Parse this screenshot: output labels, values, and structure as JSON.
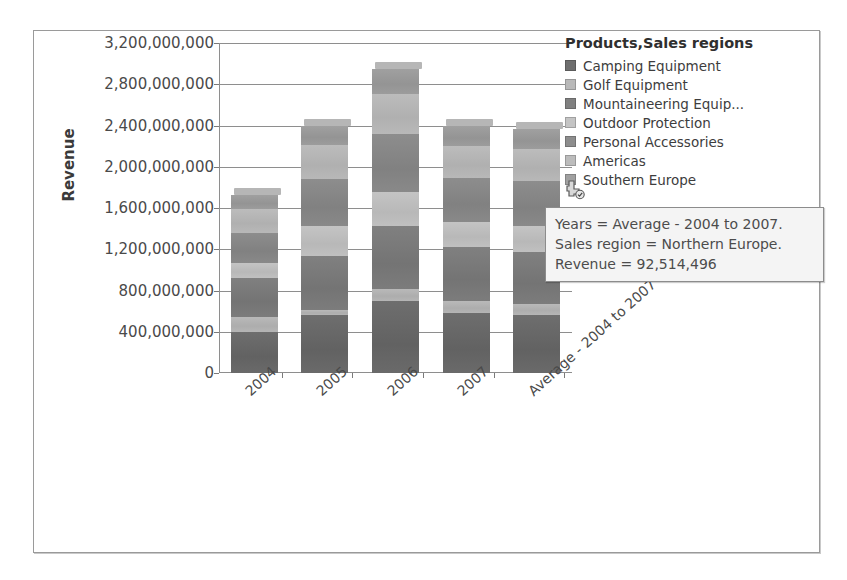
{
  "chart_data": {
    "type": "bar",
    "subtype": "stacked-column-3d",
    "title": "",
    "xlabel": "",
    "ylabel": "Revenue",
    "ylim": [
      0,
      3200000000
    ],
    "ytick_labels": [
      "3,200,000,000",
      "2,800,000,000",
      "2,400,000,000",
      "2,000,000,000",
      "1,600,000,000",
      "1,200,000,000",
      "800,000,000",
      "400,000,000",
      "0"
    ],
    "ytick_values": [
      3200000000,
      2800000000,
      2400000000,
      2000000000,
      1600000000,
      1200000000,
      800000000,
      400000000,
      0
    ],
    "grid": true,
    "legend_position": "right",
    "legend_title": "Products,Sales regions",
    "categories": [
      "2004",
      "2005",
      "2006",
      "2007",
      "Average - 2004 to 2007"
    ],
    "series": [
      {
        "name": "Camping Equipment",
        "color": "#6e6e6e",
        "values": [
          400000000,
          560000000,
          700000000,
          580000000,
          560000000
        ]
      },
      {
        "name": "Golf Equipment",
        "color": "#b9b9b9",
        "values": [
          140000000,
          50000000,
          110000000,
          120000000,
          105000000
        ]
      },
      {
        "name": "Mountaineering Equip...",
        "color": "#808080",
        "values": [
          380000000,
          520000000,
          620000000,
          520000000,
          510000000
        ]
      },
      {
        "name": "Outdoor Protection",
        "color": "#c4c4c4",
        "values": [
          150000000,
          300000000,
          330000000,
          240000000,
          255000000
        ]
      },
      {
        "name": "Personal Accessories",
        "color": "#8d8d8d",
        "values": [
          290000000,
          450000000,
          560000000,
          430000000,
          430000000
        ]
      },
      {
        "name": "Americas",
        "color": "#bcbcbc",
        "values": [
          230000000,
          330000000,
          390000000,
          310000000,
          315000000
        ]
      },
      {
        "name": "Southern Europe",
        "color": "#a0a0a0",
        "values": [
          140000000,
          190000000,
          240000000,
          200000000,
          195000000
        ]
      }
    ],
    "bar_totals": [
      1730000000,
      2400000000,
      2950000000,
      2400000000,
      2370000000
    ]
  },
  "legend": {
    "title": "Products,Sales regions",
    "items": [
      {
        "label": "Camping Equipment",
        "color": "#6e6e6e"
      },
      {
        "label": "Golf Equipment",
        "color": "#b9b9b9"
      },
      {
        "label": "Mountaineering Equip...",
        "color": "#808080"
      },
      {
        "label": "Outdoor Protection",
        "color": "#c4c4c4"
      },
      {
        "label": "Personal Accessories",
        "color": "#8d8d8d"
      },
      {
        "label": "Americas",
        "color": "#bcbcbc"
      },
      {
        "label": "Southern Europe",
        "color": "#a0a0a0"
      }
    ]
  },
  "tooltip": {
    "line1": "Years = Average - 2004 to 2007.",
    "line2": "Sales region = Northern Europe.",
    "line3": "Revenue = 92,514,496"
  },
  "cursor": {
    "icon": "pointer-add-icon"
  },
  "colors": {
    "axis": "#8e8e8e",
    "text": "#4a4a4a",
    "frame_border": "#9a9a9a",
    "tooltip_bg": "#f4f4f4"
  }
}
